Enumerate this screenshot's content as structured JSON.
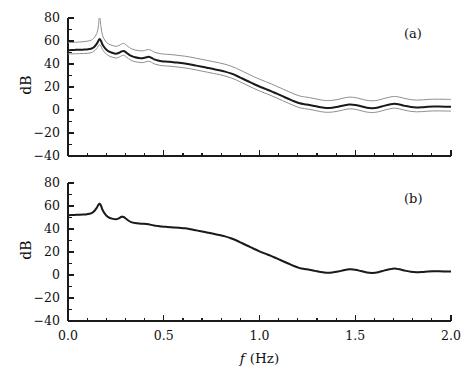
{
  "figure": {
    "width": 466,
    "height": 383,
    "background": "#ffffff",
    "xlabel_math": "f",
    "xlabel_unit": "(Hz)",
    "ylabel": "dB"
  },
  "axes_style": {
    "line_color": "#1a1a1a",
    "main_curve_color": "#1a1a1a",
    "bound_curve_color": "#8f8f8f",
    "secondary_curve_color": "#9a9a9a"
  },
  "panels": [
    {
      "tag": "(a)",
      "tag_x": 404,
      "tag_y": 26,
      "plot": {
        "left": 68,
        "top": 18,
        "right": 451,
        "bottom": 156
      },
      "xticklabels_visible": false
    },
    {
      "tag": "(b)",
      "tag_x": 404,
      "tag_y": 191,
      "plot": {
        "left": 68,
        "top": 183,
        "right": 451,
        "bottom": 321
      },
      "xticklabels_visible": true
    }
  ],
  "chart_data": {
    "type": "line",
    "title": "",
    "xlabel": "f (Hz)",
    "ylabel": "dB",
    "xlim": [
      0.0,
      2.0
    ],
    "ylim": [
      -40,
      80
    ],
    "xticks": [
      0.0,
      0.5,
      1.0,
      1.5,
      2.0
    ],
    "xticklabels": [
      "0.0",
      "0.5",
      "1.0",
      "1.5",
      "2.0"
    ],
    "xminor_step": 0.1,
    "yticks": [
      -40,
      -20,
      0,
      20,
      40,
      60,
      80
    ],
    "yticklabels": [
      "-40",
      "-20",
      "0",
      "20",
      "40",
      "60",
      "80"
    ],
    "yminor_step": 10,
    "grid": false,
    "legend": null,
    "panels": [
      {
        "label": "(a)",
        "description": "Spectral estimate with upper and lower confidence bounds",
        "x": [
          0.0,
          0.02,
          0.04,
          0.06,
          0.08,
          0.1,
          0.12,
          0.135,
          0.15,
          0.158,
          0.165,
          0.172,
          0.18,
          0.195,
          0.21,
          0.23,
          0.25,
          0.265,
          0.28,
          0.29,
          0.3,
          0.315,
          0.33,
          0.35,
          0.37,
          0.39,
          0.405,
          0.42,
          0.435,
          0.45,
          0.47,
          0.49,
          0.52,
          0.55,
          0.58,
          0.61,
          0.64,
          0.67,
          0.7,
          0.73,
          0.76,
          0.79,
          0.82,
          0.85,
          0.88,
          0.91,
          0.94,
          0.97,
          1.0,
          1.03,
          1.06,
          1.09,
          1.12,
          1.15,
          1.18,
          1.21,
          1.235,
          1.26,
          1.29,
          1.32,
          1.35,
          1.38,
          1.41,
          1.44,
          1.47,
          1.5,
          1.53,
          1.56,
          1.59,
          1.62,
          1.65,
          1.68,
          1.705,
          1.73,
          1.76,
          1.79,
          1.82,
          1.85,
          1.88,
          1.91,
          1.94,
          1.97,
          2.0
        ],
        "series": [
          {
            "name": "estimate",
            "color": "#1a1a1a",
            "width": 2.0,
            "values": [
              52.0,
              52.2,
              52.3,
              52.4,
              52.5,
              52.7,
              53.2,
              54.6,
              57.5,
              60.0,
              61.8,
              60.2,
              57.0,
              53.4,
              51.2,
              49.8,
              49.0,
              49.6,
              51.0,
              51.4,
              50.6,
              48.6,
              47.0,
              45.8,
              45.2,
              45.0,
              45.6,
              46.2,
              45.4,
              44.0,
              43.0,
              42.4,
              42.0,
              41.6,
              41.0,
              40.4,
              39.6,
              38.6,
              37.6,
              36.6,
              35.6,
              34.6,
              33.4,
              31.8,
              29.8,
              27.4,
              25.0,
              22.6,
              20.4,
              18.4,
              16.4,
              14.2,
              12.0,
              9.8,
              7.6,
              5.8,
              5.0,
              4.4,
              3.4,
              2.4,
              1.8,
              2.0,
              2.8,
              4.0,
              4.8,
              4.4,
              3.2,
              2.0,
              1.6,
              2.2,
              3.6,
              4.8,
              5.4,
              4.8,
              3.6,
              2.6,
              2.2,
              2.4,
              2.8,
              3.0,
              3.0,
              2.9,
              2.8
            ]
          },
          {
            "name": "upper-bound",
            "color": "#8f8f8f",
            "width": 1.0,
            "values": [
              58.5,
              58.7,
              58.9,
              59.1,
              59.4,
              59.8,
              60.6,
              62.5,
              66.5,
              72.0,
              82.0,
              72.5,
              65.0,
              60.0,
              57.6,
              56.2,
              55.4,
              56.0,
              57.4,
              57.9,
              57.0,
              55.0,
              53.4,
              52.2,
              51.6,
              51.4,
              52.0,
              52.6,
              51.8,
              50.4,
              49.4,
              48.8,
              48.4,
              48.0,
              47.4,
              46.8,
              46.0,
              45.0,
              44.0,
              43.0,
              42.0,
              41.0,
              39.8,
              38.2,
              36.2,
              33.8,
              31.4,
              29.0,
              26.8,
              24.8,
              22.8,
              20.6,
              18.4,
              16.2,
              14.0,
              12.2,
              11.4,
              10.8,
              9.8,
              8.8,
              8.2,
              8.4,
              9.2,
              10.4,
              11.2,
              10.8,
              9.6,
              8.4,
              8.0,
              8.6,
              10.0,
              11.2,
              11.8,
              11.2,
              10.0,
              9.0,
              8.6,
              8.8,
              9.2,
              9.4,
              9.4,
              9.3,
              9.2
            ]
          },
          {
            "name": "lower-bound",
            "color": "#8f8f8f",
            "width": 1.0,
            "values": [
              48.6,
              48.8,
              48.9,
              49.0,
              49.1,
              49.3,
              49.8,
              51.0,
              53.4,
              55.5,
              56.8,
              55.6,
              52.6,
              49.4,
              47.4,
              46.0,
              45.2,
              45.8,
              47.2,
              47.6,
              46.8,
              44.8,
              43.2,
              42.0,
              41.4,
              41.2,
              41.8,
              42.4,
              41.6,
              40.2,
              39.2,
              38.6,
              38.2,
              37.8,
              37.2,
              36.6,
              35.8,
              34.8,
              33.8,
              32.8,
              31.8,
              30.8,
              29.6,
              28.0,
              26.0,
              23.6,
              21.2,
              18.8,
              16.6,
              14.6,
              12.6,
              10.4,
              8.2,
              6.0,
              3.8,
              2.0,
              1.2,
              0.6,
              -0.4,
              -1.4,
              -2.0,
              -1.8,
              -1.0,
              0.2,
              1.0,
              0.6,
              -0.6,
              -1.8,
              -2.2,
              -1.6,
              -0.2,
              1.0,
              1.6,
              1.0,
              -0.2,
              -1.2,
              -1.6,
              -1.4,
              -1.0,
              -0.8,
              -0.8,
              -0.9,
              -1.0
            ]
          }
        ]
      },
      {
        "label": "(b)",
        "description": "Smoothed spectral estimate, two nearly coincident curves",
        "x": [
          0.0,
          0.02,
          0.04,
          0.06,
          0.08,
          0.1,
          0.12,
          0.135,
          0.15,
          0.158,
          0.165,
          0.172,
          0.18,
          0.195,
          0.21,
          0.23,
          0.25,
          0.265,
          0.28,
          0.29,
          0.3,
          0.315,
          0.33,
          0.35,
          0.37,
          0.39,
          0.405,
          0.42,
          0.435,
          0.45,
          0.47,
          0.49,
          0.52,
          0.55,
          0.58,
          0.61,
          0.64,
          0.67,
          0.7,
          0.73,
          0.76,
          0.79,
          0.82,
          0.85,
          0.88,
          0.91,
          0.94,
          0.97,
          1.0,
          1.03,
          1.06,
          1.09,
          1.12,
          1.15,
          1.18,
          1.21,
          1.235,
          1.26,
          1.29,
          1.32,
          1.35,
          1.38,
          1.41,
          1.44,
          1.47,
          1.5,
          1.53,
          1.56,
          1.59,
          1.62,
          1.65,
          1.68,
          1.705,
          1.73,
          1.76,
          1.79,
          1.82,
          1.85,
          1.88,
          1.91,
          1.94,
          1.97,
          2.0
        ],
        "series": [
          {
            "name": "estimate",
            "color": "#1a1a1a",
            "width": 2.0,
            "values": [
              52.0,
              52.2,
              52.3,
              52.4,
              52.6,
              52.9,
              53.6,
              55.2,
              58.4,
              60.8,
              62.0,
              60.4,
              56.8,
              52.8,
              50.4,
              49.0,
              48.4,
              49.2,
              50.6,
              50.4,
              49.4,
              47.4,
              46.0,
              45.2,
              44.8,
              44.6,
              44.4,
              44.2,
              43.6,
              43.0,
              42.6,
              42.2,
              41.8,
              41.4,
              41.0,
              40.6,
              39.8,
              38.8,
              37.8,
              36.8,
              35.8,
              34.8,
              33.6,
              32.0,
              30.0,
              27.6,
              25.2,
              22.8,
              20.6,
              18.6,
              16.6,
              14.4,
              12.2,
              10.0,
              7.8,
              6.0,
              5.2,
              4.6,
              3.6,
              2.6,
              2.0,
              2.2,
              3.0,
              4.2,
              5.0,
              4.6,
              3.4,
              2.2,
              1.8,
              2.4,
              3.8,
              5.0,
              5.6,
              5.0,
              3.8,
              2.8,
              2.4,
              2.6,
              3.0,
              3.2,
              3.2,
              3.1,
              3.0
            ]
          },
          {
            "name": "overlay",
            "color": "#9a9a9a",
            "width": 1.0,
            "values": [
              52.0,
              52.2,
              52.3,
              52.4,
              52.6,
              52.9,
              53.7,
              55.4,
              58.8,
              61.3,
              62.6,
              60.8,
              57.0,
              52.9,
              50.4,
              49.0,
              48.4,
              49.4,
              51.1,
              50.9,
              49.7,
              47.6,
              46.1,
              45.3,
              44.9,
              44.7,
              44.5,
              44.3,
              43.7,
              43.1,
              42.7,
              42.3,
              41.9,
              41.5,
              41.1,
              40.7,
              39.9,
              38.9,
              37.9,
              36.9,
              35.9,
              34.9,
              33.7,
              32.1,
              30.1,
              27.7,
              25.3,
              22.9,
              20.7,
              18.7,
              16.7,
              14.5,
              12.3,
              10.1,
              7.9,
              6.1,
              5.3,
              4.7,
              3.7,
              2.7,
              2.1,
              2.3,
              3.1,
              4.3,
              5.1,
              4.7,
              3.5,
              2.3,
              1.9,
              2.5,
              3.9,
              5.1,
              5.7,
              5.1,
              3.9,
              2.9,
              2.5,
              2.7,
              3.1,
              3.3,
              3.3,
              3.2,
              3.1
            ]
          }
        ]
      }
    ]
  }
}
